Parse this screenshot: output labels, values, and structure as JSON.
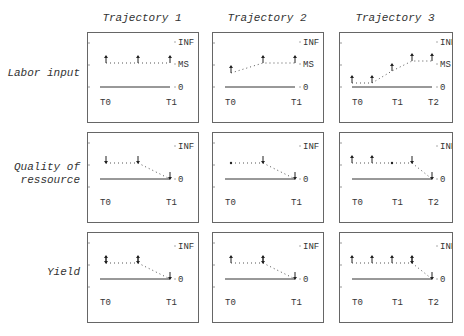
{
  "columns": [
    {
      "title": "Trajectory 1"
    },
    {
      "title": "Trajectory 2"
    },
    {
      "title": "Trajectory 3"
    }
  ],
  "rows": [
    {
      "label_lines": [
        "Labor input"
      ],
      "levels": [
        "INF",
        "MS",
        "0"
      ]
    },
    {
      "label_lines": [
        "Quality of",
        "ressource"
      ],
      "levels": [
        "INF",
        "0"
      ]
    },
    {
      "label_lines": [
        "Yield"
      ],
      "levels": [
        "INF",
        "0"
      ]
    }
  ],
  "time_labels": {
    "traj1": [
      "↑0",
      "↑1"
    ],
    "traj2": [
      "↑0",
      "↑1"
    ],
    "traj3": [
      "↑0",
      "↑1",
      "↑2"
    ]
  },
  "panels": [
    {
      "row": 0,
      "col": 0,
      "points": [
        {
          "x": 18,
          "y": 30,
          "glyph": "up"
        },
        {
          "x": 50,
          "y": 30,
          "glyph": "up"
        },
        {
          "x": 82,
          "y": 30,
          "glyph": "up"
        }
      ]
    },
    {
      "row": 0,
      "col": 1,
      "points": [
        {
          "x": 18,
          "y": 40,
          "glyph": "up"
        },
        {
          "x": 50,
          "y": 30,
          "glyph": "up"
        },
        {
          "x": 82,
          "y": 30,
          "glyph": "up"
        }
      ]
    },
    {
      "row": 0,
      "col": 2,
      "points": [
        {
          "x": 12,
          "y": 50,
          "glyph": "up"
        },
        {
          "x": 32,
          "y": 50,
          "glyph": "up"
        },
        {
          "x": 52,
          "y": 38,
          "glyph": "up"
        },
        {
          "x": 72,
          "y": 28,
          "glyph": "up"
        },
        {
          "x": 92,
          "y": 28,
          "glyph": "up"
        }
      ]
    },
    {
      "row": 1,
      "col": 0,
      "points": [
        {
          "x": 18,
          "y": 30,
          "glyph": "down"
        },
        {
          "x": 50,
          "y": 30,
          "glyph": "down"
        },
        {
          "x": 82,
          "y": 46,
          "glyph": "down"
        }
      ]
    },
    {
      "row": 1,
      "col": 1,
      "points": [
        {
          "x": 18,
          "y": 30,
          "glyph": "dot"
        },
        {
          "x": 50,
          "y": 30,
          "glyph": "down"
        },
        {
          "x": 82,
          "y": 46,
          "glyph": "down"
        }
      ]
    },
    {
      "row": 1,
      "col": 2,
      "points": [
        {
          "x": 12,
          "y": 30,
          "glyph": "up"
        },
        {
          "x": 32,
          "y": 30,
          "glyph": "up"
        },
        {
          "x": 52,
          "y": 30,
          "glyph": "dot"
        },
        {
          "x": 72,
          "y": 30,
          "glyph": "down"
        },
        {
          "x": 92,
          "y": 46,
          "glyph": "down"
        }
      ]
    },
    {
      "row": 2,
      "col": 0,
      "points": [
        {
          "x": 18,
          "y": 30,
          "glyph": "updown"
        },
        {
          "x": 50,
          "y": 30,
          "glyph": "updown"
        },
        {
          "x": 82,
          "y": 46,
          "glyph": "down"
        }
      ]
    },
    {
      "row": 2,
      "col": 1,
      "points": [
        {
          "x": 18,
          "y": 30,
          "glyph": "up"
        },
        {
          "x": 50,
          "y": 30,
          "glyph": "updown"
        },
        {
          "x": 82,
          "y": 46,
          "glyph": "down"
        }
      ]
    },
    {
      "row": 2,
      "col": 2,
      "points": [
        {
          "x": 12,
          "y": 30,
          "glyph": "up"
        },
        {
          "x": 32,
          "y": 30,
          "glyph": "up"
        },
        {
          "x": 52,
          "y": 30,
          "glyph": "up"
        },
        {
          "x": 72,
          "y": 30,
          "glyph": "updown"
        },
        {
          "x": 92,
          "y": 46,
          "glyph": "down"
        }
      ]
    }
  ]
}
